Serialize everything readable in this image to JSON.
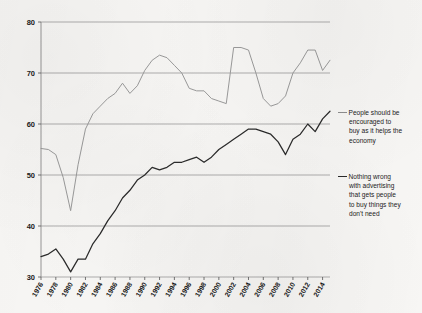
{
  "chart_data": {
    "type": "line",
    "title": "",
    "subtitle": "",
    "xlabel": "",
    "ylabel": "",
    "xlim": [
      1976,
      2015
    ],
    "ylim": [
      30,
      80
    ],
    "yticks": [
      30,
      40,
      50,
      60,
      70,
      80
    ],
    "xticks": [
      1976,
      1978,
      1980,
      1982,
      1984,
      1986,
      1988,
      1990,
      1992,
      1994,
      1996,
      1998,
      2000,
      2002,
      2004,
      2006,
      2008,
      2010,
      2012,
      2014
    ],
    "xtick_labels": [
      "1976",
      "1978",
      "1980",
      "1982",
      "1984",
      "1986",
      "1988",
      "1990",
      "1992",
      "1994",
      "1996",
      "1998",
      "2000",
      "2002",
      "2004",
      "2006",
      "2008",
      "2010",
      "2012",
      "2014"
    ],
    "grid": true,
    "grid_axis": "y",
    "legend_position": "right",
    "x": [
      1976,
      1977,
      1978,
      1979,
      1980,
      1981,
      1982,
      1983,
      1984,
      1985,
      1986,
      1987,
      1988,
      1989,
      1990,
      1991,
      1992,
      1993,
      1994,
      1995,
      1996,
      1997,
      1998,
      1999,
      2000,
      2001,
      2002,
      2003,
      2004,
      2005,
      2006,
      2007,
      2008,
      2009,
      2010,
      2011,
      2012,
      2013,
      2014,
      2015
    ],
    "series": [
      {
        "name": "People should be encouraged to buy as it helps the economy",
        "color": "#9a9a9a",
        "values": [
          55.2,
          55.0,
          54.0,
          49.5,
          43.0,
          52.0,
          59.0,
          62.0,
          63.5,
          65.0,
          66.0,
          68.0,
          66.0,
          67.5,
          70.5,
          72.5,
          73.5,
          73.0,
          71.5,
          70.0,
          67.0,
          66.5,
          66.5,
          65.0,
          64.5,
          64.0,
          75.0,
          75.0,
          74.5,
          70.0,
          65.0,
          63.5,
          64.0,
          65.5,
          70.0,
          72.0,
          74.5,
          74.5,
          70.5,
          72.5
        ]
      },
      {
        "name": "Nothing wrong with advertising that gets people to buy things they don't need",
        "color": "#2b2b2b",
        "values": [
          34.0,
          34.5,
          35.5,
          33.5,
          31.0,
          33.5,
          33.5,
          36.5,
          38.5,
          41.0,
          43.0,
          45.5,
          47.0,
          49.0,
          50.0,
          51.5,
          51.0,
          51.5,
          52.5,
          52.5,
          53.0,
          53.5,
          52.5,
          53.5,
          55.0,
          56.0,
          57.0,
          58.0,
          59.0,
          59.0,
          58.5,
          58.0,
          56.5,
          54.0,
          57.0,
          58.0,
          60.0,
          58.5,
          61.0,
          62.5
        ]
      }
    ]
  },
  "legend": [
    {
      "id": "legend-encourage-buy",
      "lines": [
        "People should be",
        "encouraged to",
        "buy as it helps the",
        "economy"
      ]
    },
    {
      "id": "legend-advertising",
      "lines": [
        "Nothing wrong",
        "with advertising",
        "that gets people",
        "to buy things they",
        "don't need"
      ]
    }
  ]
}
